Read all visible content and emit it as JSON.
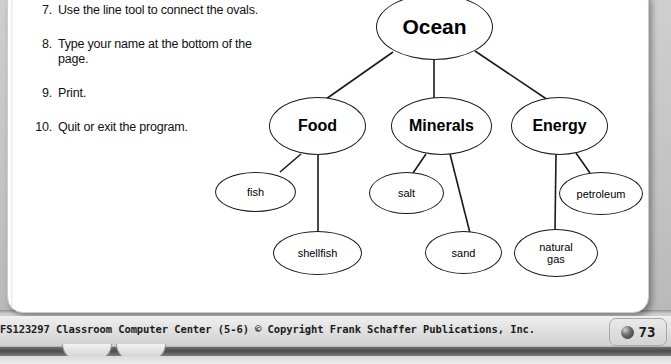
{
  "page": {
    "steps": [
      {
        "num": "7.",
        "text": "Use the line tool to connect the ovals."
      },
      {
        "num": "8.",
        "text": "Type your name at the bottom of the page."
      },
      {
        "num": "9.",
        "text": "Print."
      },
      {
        "num": "10.",
        "text": "Quit or exit the program."
      }
    ]
  },
  "diagram": {
    "nodes": {
      "root": "Ocean",
      "food": "Food",
      "minerals": "Minerals",
      "energy": "Energy",
      "fish": "fish",
      "shellfish": "shellfish",
      "salt": "salt",
      "sand": "sand",
      "petroleum": "petroleum",
      "natural_gas": "natural\ngas"
    },
    "edges": [
      [
        "Ocean",
        "Food"
      ],
      [
        "Ocean",
        "Minerals"
      ],
      [
        "Ocean",
        "Energy"
      ],
      [
        "Food",
        "fish"
      ],
      [
        "Food",
        "shellfish"
      ],
      [
        "Minerals",
        "salt"
      ],
      [
        "Minerals",
        "sand"
      ],
      [
        "Energy",
        "petroleum"
      ],
      [
        "Energy",
        "natural gas"
      ]
    ],
    "line_color": "#1a1a1a",
    "node_fill": "#ffffff"
  },
  "footer": {
    "credit": "FS123297 Classroom Computer Center (5-6) © Copyright Frank Schaffer Publications, Inc.",
    "page_number": "73",
    "bullet_icon": "sphere-icon"
  }
}
